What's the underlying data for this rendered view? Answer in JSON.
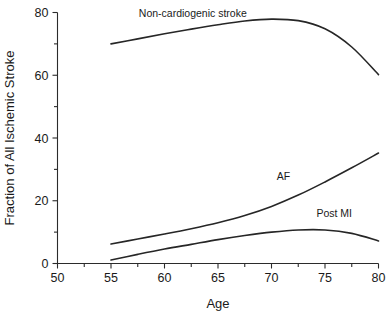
{
  "chart_data": {
    "type": "line",
    "title": "",
    "xlabel": "Age",
    "ylabel": "Fraction of All Ischemic Stroke",
    "xlim": [
      50,
      80
    ],
    "ylim": [
      0,
      80
    ],
    "x_ticks": [
      50,
      55,
      60,
      65,
      70,
      75,
      80
    ],
    "x_tick_labels": [
      "50",
      "55",
      "60",
      "65",
      "70",
      "75",
      "80"
    ],
    "x_minor_ticks": [
      52.5,
      57.5,
      62.5,
      67.5,
      72.5,
      77.5
    ],
    "y_ticks": [
      0,
      20,
      40,
      60,
      80
    ],
    "y_tick_labels": [
      "0",
      "20",
      "40",
      "60",
      "80"
    ],
    "y_minor_ticks": [
      10,
      30,
      50,
      70
    ],
    "grid": false,
    "legend": "inline-labels",
    "series": [
      {
        "name": "Non-cardiogenic stroke",
        "label": "Non-cardiogenic stroke",
        "label_x": 57.6,
        "label_y": 78.5,
        "x": [
          55,
          57.5,
          60,
          62.5,
          65,
          67.5,
          70,
          72.5,
          75,
          77.5,
          80
        ],
        "values": [
          70.0,
          71.6,
          73.2,
          74.7,
          76.1,
          77.3,
          77.9,
          77.4,
          74.8,
          69.0,
          60.2
        ]
      },
      {
        "name": "AF",
        "label": "AF",
        "label_x": 70.5,
        "label_y": 26.5,
        "x": [
          55,
          57.5,
          60,
          62.5,
          65,
          67.5,
          70,
          72.5,
          75,
          77.5,
          80
        ],
        "values": [
          6.2,
          7.8,
          9.4,
          11.1,
          13.0,
          15.3,
          18.2,
          21.8,
          26.0,
          30.5,
          35.2
        ]
      },
      {
        "name": "Post MI",
        "label": "Post MI",
        "label_x": 74.2,
        "label_y": 14.8,
        "x": [
          55,
          57.5,
          60,
          62.5,
          65,
          67.5,
          70,
          72.5,
          75,
          77.5,
          80
        ],
        "values": [
          1.1,
          2.9,
          4.6,
          6.1,
          7.6,
          8.9,
          10.0,
          10.7,
          10.7,
          9.6,
          7.2
        ]
      }
    ]
  }
}
